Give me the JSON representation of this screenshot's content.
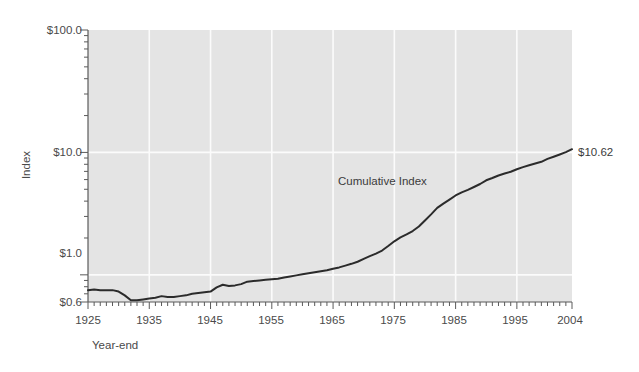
{
  "chart_data": {
    "type": "line",
    "title": "",
    "xlabel": "Year-end",
    "ylabel": "Index",
    "yscale": "log",
    "ylim": [
      0.6,
      100.0
    ],
    "xlim": [
      1925,
      2004
    ],
    "grid": true,
    "legend": "none",
    "y_tick_labels": [
      "$100.0",
      "$10.0",
      "$1.0",
      "$0.6"
    ],
    "y_tick_values": [
      100.0,
      10.0,
      1.0,
      0.6
    ],
    "x_tick_labels": [
      "1925",
      "1935",
      "1945",
      "1955",
      "1965",
      "1975",
      "1985",
      "1995",
      "2004"
    ],
    "x_tick_values": [
      1925,
      1935,
      1945,
      1955,
      1965,
      1975,
      1985,
      1995,
      2004
    ],
    "series": [
      {
        "name": "Cumulative Index",
        "color": "#2b2b2b",
        "end_label": "$10.62",
        "end_value": 10.62,
        "x": [
          1925,
          1926,
          1927,
          1928,
          1929,
          1930,
          1931,
          1932,
          1933,
          1934,
          1935,
          1936,
          1937,
          1938,
          1939,
          1940,
          1941,
          1942,
          1943,
          1944,
          1945,
          1946,
          1947,
          1948,
          1949,
          1950,
          1951,
          1952,
          1953,
          1954,
          1955,
          1956,
          1957,
          1958,
          1959,
          1960,
          1961,
          1962,
          1963,
          1964,
          1965,
          1966,
          1967,
          1968,
          1969,
          1970,
          1971,
          1972,
          1973,
          1974,
          1975,
          1976,
          1977,
          1978,
          1979,
          1980,
          1981,
          1982,
          1983,
          1984,
          1985,
          1986,
          1987,
          1988,
          1989,
          1990,
          1991,
          1992,
          1993,
          1994,
          1995,
          1996,
          1997,
          1998,
          1999,
          2000,
          2001,
          2002,
          2003,
          2004
        ],
        "y": [
          0.75,
          0.76,
          0.75,
          0.75,
          0.75,
          0.73,
          0.68,
          0.62,
          0.62,
          0.63,
          0.64,
          0.65,
          0.67,
          0.66,
          0.66,
          0.67,
          0.68,
          0.7,
          0.71,
          0.72,
          0.73,
          0.79,
          0.83,
          0.81,
          0.82,
          0.84,
          0.88,
          0.89,
          0.9,
          0.91,
          0.92,
          0.93,
          0.95,
          0.97,
          0.99,
          1.01,
          1.03,
          1.05,
          1.07,
          1.09,
          1.12,
          1.15,
          1.19,
          1.23,
          1.28,
          1.35,
          1.42,
          1.49,
          1.58,
          1.72,
          1.88,
          2.02,
          2.14,
          2.28,
          2.48,
          2.78,
          3.12,
          3.52,
          3.82,
          4.12,
          4.45,
          4.72,
          4.95,
          5.22,
          5.52,
          5.92,
          6.18,
          6.48,
          6.72,
          6.95,
          7.28,
          7.58,
          7.85,
          8.12,
          8.38,
          8.85,
          9.22,
          9.62,
          10.05,
          10.62
        ]
      }
    ],
    "annotations": [
      {
        "text": "Cumulative Index",
        "x": 1965,
        "y": 2.2
      }
    ]
  },
  "labels": {
    "y_axis_title": "Index",
    "x_axis_title": "Year-end",
    "series_annotation": "Cumulative Index",
    "end_value_label": "$10.62",
    "y_100": "$100.0",
    "y_10": "$10.0",
    "y_1": "$1.0",
    "y_06": "$0.6",
    "x_1925": "1925",
    "x_1935": "1935",
    "x_1945": "1945",
    "x_1955": "1955",
    "x_1965": "1965",
    "x_1975": "1975",
    "x_1985": "1985",
    "x_1995": "1995",
    "x_2004": "2004"
  },
  "colors": {
    "plot_background": "#e4e4e4",
    "gridline": "#fbfbfb",
    "axis": "#5a5a5a",
    "line": "#2b2b2b",
    "text": "#4a4a4a",
    "page_background": "#ffffff"
  }
}
